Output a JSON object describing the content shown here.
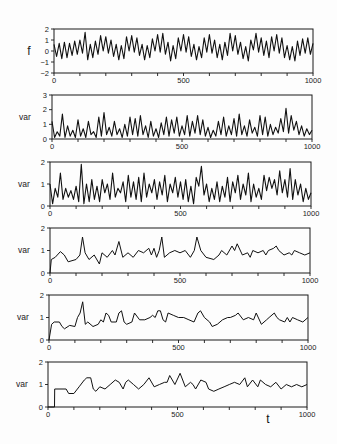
{
  "figure": {
    "panel_count": 6,
    "line_color": "#111111",
    "background": "#fdfdfd"
  },
  "chart_data": [
    {
      "type": "line",
      "title": "",
      "ylabel": "f",
      "xlabel": "",
      "xlim": [
        0,
        1000
      ],
      "ylim": [
        -2,
        2
      ],
      "yticks": [
        -2,
        -1,
        0,
        1,
        2
      ],
      "xticks_minor_step": 100,
      "xtick_labels": [
        0,
        500,
        1000
      ],
      "grid": false,
      "x_start": 0,
      "x_step": 10,
      "values": [
        0.6,
        -0.5,
        0.7,
        -0.7,
        0.8,
        -0.6,
        0.7,
        -0.4,
        0.9,
        -0.3,
        1.0,
        -0.2,
        1.7,
        -0.8,
        0.6,
        -0.6,
        0.9,
        -0.3,
        1.4,
        0.0,
        1.3,
        -0.2,
        1.0,
        -0.5,
        0.6,
        -0.8,
        0.5,
        -0.7,
        1.3,
        0.0,
        1.4,
        -0.1,
        1.2,
        -0.4,
        0.6,
        -0.8,
        0.5,
        -0.6,
        1.1,
        0.0,
        1.5,
        -0.1,
        1.6,
        -0.3,
        0.8,
        -0.9,
        0.5,
        -0.7,
        1.2,
        0.0,
        1.5,
        -0.1,
        1.3,
        -0.5,
        0.6,
        -0.8,
        0.4,
        -0.6,
        1.2,
        -0.1,
        1.5,
        -0.2,
        1.0,
        -0.6,
        0.6,
        -0.8,
        0.8,
        -0.4,
        1.6,
        0.0,
        1.4,
        -0.3,
        0.8,
        -0.7,
        0.4,
        -0.9,
        1.0,
        0.1,
        1.6,
        -0.1,
        1.2,
        -0.4,
        0.9,
        -0.6,
        1.3,
        0.0,
        1.5,
        -0.2,
        1.2,
        -0.6,
        0.5,
        -0.8,
        0.4,
        -0.9,
        0.9,
        -0.4,
        1.1,
        -0.2,
        1.2,
        -0.3,
        0.7
      ]
    },
    {
      "type": "line",
      "title": "",
      "ylabel": "var",
      "xlabel": "",
      "xlim": [
        0,
        1000
      ],
      "ylim": [
        0,
        3
      ],
      "yticks": [
        0,
        1,
        2,
        3
      ],
      "xticks_minor_step": 100,
      "xtick_labels": [
        0,
        500,
        1000
      ],
      "grid": false,
      "x_start": 0,
      "x_step": 10,
      "values": [
        1.2,
        0.1,
        0.5,
        0.2,
        1.7,
        0.1,
        0.9,
        0.2,
        0.6,
        0.1,
        1.3,
        0.2,
        0.7,
        0.1,
        1.2,
        0.3,
        0.5,
        0.1,
        1.5,
        0.2,
        1.8,
        0.3,
        0.8,
        0.2,
        1.2,
        0.3,
        0.7,
        0.1,
        1.0,
        0.2,
        1.5,
        0.3,
        1.4,
        0.2,
        1.6,
        0.3,
        0.9,
        0.1,
        1.2,
        0.2,
        0.7,
        0.1,
        1.1,
        0.3,
        1.5,
        0.2,
        1.3,
        0.4,
        1.5,
        0.2,
        0.9,
        0.3,
        1.6,
        0.2,
        1.2,
        0.4,
        1.6,
        0.3,
        1.3,
        0.2,
        0.8,
        0.1,
        0.6,
        0.2,
        1.2,
        0.3,
        1.5,
        0.2,
        0.9,
        0.3,
        1.4,
        0.2,
        1.7,
        0.3,
        0.9,
        0.2,
        1.3,
        0.4,
        0.8,
        0.2,
        1.6,
        0.3,
        1.5,
        0.2,
        1.0,
        0.3,
        0.8,
        0.4,
        1.4,
        0.5,
        2.1,
        0.4,
        1.6,
        0.6,
        1.2,
        0.3,
        0.9,
        0.2,
        0.7,
        0.3,
        0.6
      ]
    },
    {
      "type": "line",
      "title": "",
      "ylabel": "var",
      "xlabel": "",
      "xlim": [
        0,
        1000
      ],
      "ylim": [
        0,
        2
      ],
      "yticks": [
        0,
        1,
        2
      ],
      "xticks_minor_step": 100,
      "xtick_labels": [
        0,
        500,
        1000
      ],
      "grid": false,
      "x_start": 0,
      "x_step": 10,
      "values": [
        1.0,
        0.1,
        0.8,
        0.4,
        1.5,
        0.3,
        0.8,
        0.4,
        0.7,
        0.3,
        0.9,
        0.2,
        1.9,
        0.1,
        1.0,
        0.2,
        1.2,
        0.3,
        0.9,
        0.2,
        1.2,
        0.6,
        1.0,
        0.3,
        1.5,
        0.4,
        0.8,
        0.6,
        1.1,
        0.2,
        1.4,
        0.4,
        1.1,
        0.3,
        1.3,
        0.2,
        1.5,
        0.4,
        1.0,
        0.6,
        1.2,
        0.3,
        1.1,
        0.5,
        1.4,
        0.2,
        1.0,
        0.6,
        1.3,
        0.4,
        1.1,
        0.3,
        1.2,
        0.2,
        0.9,
        0.1,
        1.3,
        0.9,
        1.8,
        0.5,
        1.0,
        0.2,
        0.8,
        0.3,
        1.1,
        0.2,
        0.9,
        0.4,
        1.3,
        0.2,
        1.1,
        0.6,
        1.4,
        0.3,
        1.0,
        0.5,
        1.5,
        0.2,
        1.0,
        0.4,
        0.8,
        0.3,
        1.4,
        0.7,
        1.3,
        0.8,
        1.2,
        0.5,
        1.6,
        0.6,
        1.2,
        0.4,
        1.7,
        0.3,
        1.2,
        0.5,
        1.0,
        0.2,
        0.8,
        0.3,
        0.6
      ]
    },
    {
      "type": "line",
      "title": "",
      "ylabel": "var",
      "xlabel": "",
      "xlim": [
        0,
        1000
      ],
      "ylim": [
        0,
        2
      ],
      "yticks": [
        0,
        1,
        2
      ],
      "xticks_minor_step": 100,
      "xtick_labels": [
        0,
        500,
        1000
      ],
      "grid": false,
      "x": [
        0,
        5,
        20,
        40,
        55,
        70,
        100,
        115,
        125,
        135,
        150,
        170,
        190,
        200,
        220,
        240,
        250,
        265,
        280,
        300,
        320,
        340,
        360,
        380,
        390,
        400,
        410,
        420,
        430,
        440,
        460,
        480,
        500,
        520,
        540,
        555,
        565,
        580,
        600,
        630,
        650,
        660,
        680,
        700,
        710,
        720,
        740,
        760,
        770,
        780,
        800,
        820,
        830,
        840,
        860,
        870,
        880,
        900,
        920,
        930,
        940,
        960,
        980,
        1000
      ],
      "y": [
        0,
        0.6,
        0.7,
        0.95,
        0.8,
        0.5,
        0.6,
        0.8,
        1.6,
        0.9,
        0.6,
        0.8,
        0.4,
        0.9,
        0.7,
        1.0,
        0.8,
        1.4,
        0.7,
        0.9,
        0.7,
        1.0,
        0.9,
        1.1,
        0.8,
        1.1,
        0.7,
        1.0,
        1.6,
        0.7,
        0.9,
        1.0,
        0.9,
        1.0,
        0.7,
        1.0,
        1.6,
        1.0,
        0.7,
        0.6,
        0.8,
        1.0,
        0.8,
        1.2,
        1.0,
        1.3,
        0.8,
        0.9,
        0.7,
        1.0,
        0.9,
        1.0,
        0.8,
        1.0,
        1.1,
        1.2,
        1.0,
        0.8,
        0.9,
        0.8,
        1.0,
        0.9,
        0.8,
        0.9
      ]
    },
    {
      "type": "line",
      "title": "",
      "ylabel": "var",
      "xlabel": "",
      "xlim": [
        0,
        1000
      ],
      "ylim": [
        0,
        2
      ],
      "yticks": [
        0,
        1,
        2
      ],
      "xticks_minor_step": 100,
      "xtick_labels": [
        0,
        500,
        1000
      ],
      "grid": false,
      "x": [
        0,
        10,
        20,
        40,
        50,
        60,
        80,
        100,
        110,
        120,
        130,
        140,
        150,
        170,
        190,
        200,
        210,
        220,
        230,
        240,
        260,
        270,
        280,
        290,
        300,
        320,
        330,
        350,
        370,
        390,
        400,
        410,
        420,
        430,
        440,
        450,
        460,
        480,
        500,
        520,
        540,
        560,
        575,
        585,
        600,
        620,
        630,
        650,
        670,
        690,
        700,
        720,
        730,
        750,
        770,
        790,
        800,
        820,
        840,
        850,
        870,
        880,
        890,
        910,
        920,
        930,
        940,
        960,
        980,
        1000
      ],
      "y": [
        0,
        0.7,
        0.8,
        0.8,
        0.6,
        0.5,
        0.65,
        0.6,
        1.0,
        1.2,
        1.7,
        0.7,
        0.8,
        0.6,
        0.7,
        0.9,
        0.8,
        1.2,
        1.1,
        0.8,
        0.8,
        1.2,
        1.3,
        0.8,
        0.7,
        0.8,
        1.2,
        0.9,
        0.9,
        1.0,
        1.1,
        1.0,
        1.3,
        1.3,
        0.9,
        0.8,
        1.2,
        1.1,
        1.0,
        1.0,
        0.9,
        0.8,
        1.2,
        1.3,
        1.0,
        0.8,
        0.6,
        0.7,
        0.9,
        1.0,
        1.0,
        1.1,
        1.2,
        0.9,
        1.0,
        0.9,
        1.2,
        0.7,
        0.9,
        1.0,
        1.2,
        1.0,
        0.9,
        0.8,
        1.0,
        0.8,
        1.0,
        0.9,
        0.8,
        1.0
      ]
    },
    {
      "type": "line",
      "title": "",
      "ylabel": "var",
      "xlabel": "t",
      "xlim": [
        0,
        1000
      ],
      "ylim": [
        0,
        2
      ],
      "yticks": [
        0,
        1,
        2
      ],
      "xticks_minor_step": 100,
      "xtick_labels": [
        0,
        500,
        1000
      ],
      "grid": false,
      "x": [
        0,
        25,
        26,
        70,
        80,
        100,
        120,
        140,
        150,
        165,
        175,
        185,
        200,
        220,
        240,
        260,
        275,
        290,
        300,
        310,
        330,
        350,
        370,
        390,
        410,
        430,
        450,
        460,
        470,
        480,
        490,
        510,
        520,
        530,
        550,
        560,
        570,
        590,
        610,
        620,
        640,
        660,
        680,
        700,
        720,
        740,
        760,
        770,
        790,
        810,
        820,
        840,
        860,
        880,
        900,
        920,
        940,
        960,
        980,
        1000
      ],
      "y": [
        0,
        0,
        0.8,
        0.8,
        0.6,
        0.6,
        0.9,
        1.2,
        1.3,
        1.3,
        0.8,
        0.7,
        0.9,
        0.8,
        1.0,
        1.2,
        1.1,
        0.8,
        1.1,
        1.2,
        1.0,
        0.8,
        1.0,
        1.3,
        0.9,
        1.0,
        1.1,
        1.1,
        1.4,
        1.2,
        1.0,
        1.5,
        1.2,
        0.9,
        1.1,
        1.0,
        0.8,
        1.2,
        1.1,
        0.8,
        0.7,
        0.8,
        0.9,
        1.0,
        1.1,
        1.0,
        1.3,
        0.9,
        1.2,
        0.9,
        1.2,
        1.0,
        0.9,
        1.1,
        0.8,
        1.0,
        0.9,
        1.0,
        0.9,
        1.0
      ]
    }
  ]
}
